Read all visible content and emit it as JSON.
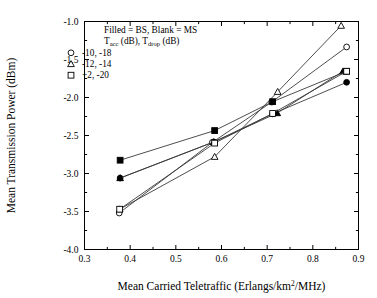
{
  "chart_data": {
    "type": "line",
    "title": "",
    "xlabel": "Mean Carried Teletraffic (Erlangs/km2/MHz)",
    "xlabel_main": "Mean Carried Teletraffic (Erlangs/km",
    "xlabel_sup": "2",
    "xlabel_tail": "/MHz)",
    "ylabel": "Mean Transmission Power (dBm)",
    "xlim": [
      0.3,
      0.9
    ],
    "ylim": [
      -4.0,
      -1.0
    ],
    "xticks": [
      0.3,
      0.4,
      0.5,
      0.6,
      0.7,
      0.8,
      0.9
    ],
    "xtick_labels": [
      "0.3",
      "0.4",
      "0.5",
      "0.6",
      "0.7",
      "0.8",
      "0.9"
    ],
    "yticks": [
      -1.0,
      -1.5,
      -2.0,
      -2.5,
      -3.0,
      -3.5,
      -4.0
    ],
    "ytick_labels": [
      "-1.0",
      "-1.5",
      "-2.0",
      "-2.5",
      "-3.0",
      "-3.5",
      "-4.0"
    ],
    "grid": false,
    "legend_position": "top-left",
    "legend_note_1": "Filled = BS, Blank = MS",
    "legend_note_2_main": "T",
    "legend_note_2_sub1": "acc",
    "legend_note_2_mid": " (dB), T",
    "legend_note_2_sub2": "drop",
    "legend_note_2_tail": " (dB)",
    "legend_entries": [
      {
        "marker": "circle",
        "label": "-10, -18"
      },
      {
        "marker": "triangle",
        "label": "-12, -14"
      },
      {
        "marker": "square",
        "label": "+2, -20"
      }
    ],
    "series": [
      {
        "name": "-10, -18 BS",
        "marker": "circle",
        "fill": "filled",
        "x": [
          0.378,
          0.583,
          0.712,
          0.874
        ],
        "y": [
          -3.06,
          -2.585,
          -2.215,
          -1.8
        ]
      },
      {
        "name": "-10, -18 MS",
        "marker": "circle",
        "fill": "open",
        "x": [
          0.376,
          0.58,
          0.71,
          0.874
        ],
        "y": [
          -3.52,
          -2.59,
          -2.06,
          -1.335
        ]
      },
      {
        "name": "-12, -14 BS",
        "marker": "triangle",
        "fill": "filled",
        "x": [
          0.378,
          0.583,
          0.722,
          0.866
        ],
        "y": [
          -3.06,
          -2.585,
          -2.205,
          -1.655
        ]
      },
      {
        "name": "-12, -14 MS",
        "marker": "triangle",
        "fill": "open",
        "x": [
          0.377,
          0.585,
          0.723,
          0.862
        ],
        "y": [
          -3.47,
          -2.78,
          -1.925,
          -1.055
        ]
      },
      {
        "name": "+2, -20 BS",
        "marker": "square",
        "fill": "filled",
        "x": [
          0.378,
          0.585,
          0.712,
          0.874
        ],
        "y": [
          -2.825,
          -2.435,
          -2.055,
          -1.655
        ]
      },
      {
        "name": "+2, -20 MS",
        "marker": "square",
        "fill": "open",
        "x": [
          0.377,
          0.585,
          0.712,
          0.874
        ],
        "y": [
          -3.47,
          -2.6,
          -2.21,
          -1.655
        ]
      }
    ]
  }
}
